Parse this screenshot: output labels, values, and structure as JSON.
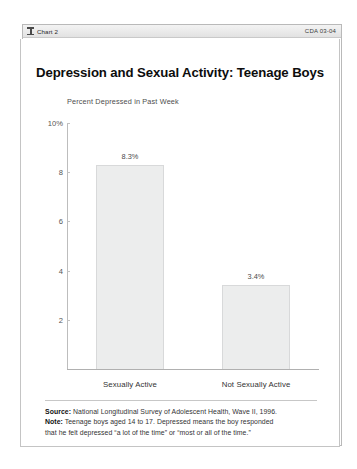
{
  "window": {
    "titlebar": {
      "icon": "chart-column-icon",
      "title": "Chart 2",
      "code": "CDA 03-04"
    }
  },
  "chart_data": {
    "type": "bar",
    "title": "Depression and Sexual Activity: Teenage Boys",
    "subtitle": "Percent Depressed in Past Week",
    "xlabel": "",
    "ylabel": "Percent Depressed in Past Week",
    "categories": [
      "Sexually Active",
      "Not Sexually Active"
    ],
    "values": [
      8.3,
      3.4
    ],
    "data_labels": [
      "8.3%",
      "3.4%"
    ],
    "ylim": [
      0,
      10
    ],
    "yticks": [
      10,
      8,
      6,
      4,
      2
    ],
    "ytick_labels": [
      "10%",
      "8",
      "6",
      "4",
      "2"
    ],
    "grid": false,
    "legend": false,
    "bar_color": "#eceded",
    "bar_border_color": "#d8d9da"
  },
  "footnotes": {
    "source_label": "Source:",
    "source_text": "National Longitudinal Survey of Adolescent Health, Wave II, 1996.",
    "note_label": "Note:",
    "note_line1": "Teenage boys aged 14 to 17. Depressed means the boy responded",
    "note_line2": "that he felt depressed “a lot of the time” or “most or all of the time.”"
  }
}
